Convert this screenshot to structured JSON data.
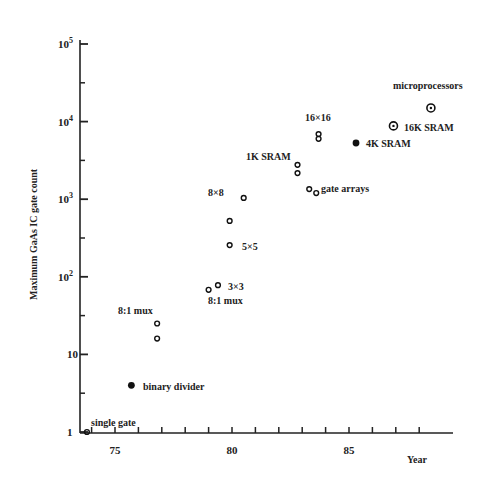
{
  "chart_data": {
    "type": "scatter",
    "title": "",
    "xlabel": "Year",
    "ylabel": "Maximum GaAs IC gate count",
    "yscale": "log",
    "xlim": [
      73.5,
      90.5
    ],
    "ylim": [
      1,
      100000
    ],
    "grid": false,
    "legend": null,
    "x_ticks": [
      {
        "value": 75,
        "label": "75"
      },
      {
        "value": 80,
        "label": "80"
      },
      {
        "value": 85,
        "label": "85"
      }
    ],
    "y_ticks": [
      {
        "value": 1,
        "label": "1",
        "sup": ""
      },
      {
        "value": 10,
        "label": "10",
        "sup": ""
      },
      {
        "value": 100,
        "label": "10",
        "sup": "2"
      },
      {
        "value": 1000,
        "label": "10",
        "sup": "3"
      },
      {
        "value": 10000,
        "label": "10",
        "sup": "4"
      },
      {
        "value": 100000,
        "label": "10",
        "sup": "5"
      }
    ],
    "points": [
      {
        "year": 73.8,
        "count": 1,
        "filled": false,
        "label": "single gate"
      },
      {
        "year": 75.7,
        "count": 4,
        "filled": true,
        "label": "binary divider"
      },
      {
        "year": 76.8,
        "count": 25,
        "filled": false,
        "label": "8:1 mux"
      },
      {
        "year": 76.8,
        "count": 16,
        "filled": false,
        "label": ""
      },
      {
        "year": 79.0,
        "count": 68,
        "filled": false,
        "label": "8:1 mux"
      },
      {
        "year": 79.4,
        "count": 78,
        "filled": false,
        "label": "3×3"
      },
      {
        "year": 79.9,
        "count": 256,
        "filled": false,
        "label": "5×5"
      },
      {
        "year": 79.9,
        "count": 525,
        "filled": false,
        "label": ""
      },
      {
        "year": 80.5,
        "count": 1040,
        "filled": false,
        "label": "8×8"
      },
      {
        "year": 82.8,
        "count": 2770,
        "filled": false,
        "label": "1K SRAM"
      },
      {
        "year": 82.8,
        "count": 2170,
        "filled": false,
        "label": ""
      },
      {
        "year": 83.3,
        "count": 1350,
        "filled": false,
        "label": "gate arrays"
      },
      {
        "year": 83.6,
        "count": 1200,
        "filled": false,
        "label": ""
      },
      {
        "year": 83.7,
        "count": 6900,
        "filled": false,
        "label": "16×16"
      },
      {
        "year": 83.7,
        "count": 6000,
        "filled": false,
        "label": ""
      },
      {
        "year": 85.3,
        "count": 5300,
        "filled": true,
        "label": "4K SRAM"
      },
      {
        "year": 86.9,
        "count": 8800,
        "filled": false,
        "label": "16K SRAM"
      },
      {
        "year": 88.5,
        "count": 15000,
        "filled": false,
        "label": "microprocessors"
      }
    ],
    "annotations": [
      {
        "text": "single gate",
        "x": 91,
        "y": 426
      },
      {
        "text": "binary divider",
        "x": 143,
        "y": 390
      },
      {
        "text": "8:1 mux",
        "x": 118,
        "y": 314
      },
      {
        "text": "8:1 mux",
        "x": 208,
        "y": 304
      },
      {
        "text": "3×3",
        "x": 228,
        "y": 290
      },
      {
        "text": "5×5",
        "x": 242,
        "y": 250
      },
      {
        "text": "8×8",
        "x": 208,
        "y": 196
      },
      {
        "text": "1K SRAM",
        "x": 246,
        "y": 160
      },
      {
        "text": "gate arrays",
        "x": 321,
        "y": 192
      },
      {
        "text": "16×16",
        "x": 305,
        "y": 121
      },
      {
        "text": "4K SRAM",
        "x": 366,
        "y": 147
      },
      {
        "text": "16K SRAM",
        "x": 404,
        "y": 131
      },
      {
        "text": "microprocessors",
        "x": 393,
        "y": 89
      }
    ]
  }
}
